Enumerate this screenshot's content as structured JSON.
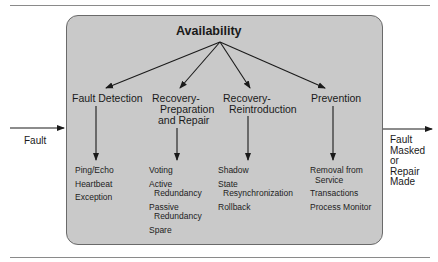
{
  "diagram": {
    "title": "Availability",
    "input_label": "Fault",
    "output_label_lines": [
      "Fault",
      "Masked",
      "or",
      "Repair",
      "Made"
    ],
    "colors": {
      "box_fill": "#c9c9c9",
      "box_border": "#6a6a6a",
      "line": "#1a1a1a"
    },
    "categories": [
      {
        "header_lines": [
          "Fault Detection"
        ],
        "tactics": [
          {
            "lines": [
              "Ping/Echo"
            ]
          },
          {
            "lines": [
              "Heartbeat"
            ]
          },
          {
            "lines": [
              "Exception"
            ]
          }
        ]
      },
      {
        "header_lines": [
          "Recovery-",
          "Preparation",
          "and Repair"
        ],
        "tactics": [
          {
            "lines": [
              "Voting"
            ]
          },
          {
            "lines": [
              "Active",
              "Redundancy"
            ]
          },
          {
            "lines": [
              "Passive",
              "Redundancy"
            ]
          },
          {
            "lines": [
              "Spare"
            ]
          }
        ]
      },
      {
        "header_lines": [
          "Recovery-",
          "Reintroduction"
        ],
        "tactics": [
          {
            "lines": [
              "Shadow"
            ]
          },
          {
            "lines": [
              "State",
              "Resynchronization"
            ]
          },
          {
            "lines": [
              "Rollback"
            ]
          }
        ]
      },
      {
        "header_lines": [
          "Prevention"
        ],
        "tactics": [
          {
            "lines": [
              "Removal from",
              "Service"
            ]
          },
          {
            "lines": [
              "Transactions"
            ]
          },
          {
            "lines": [
              "Process Monitor"
            ]
          }
        ]
      }
    ]
  }
}
